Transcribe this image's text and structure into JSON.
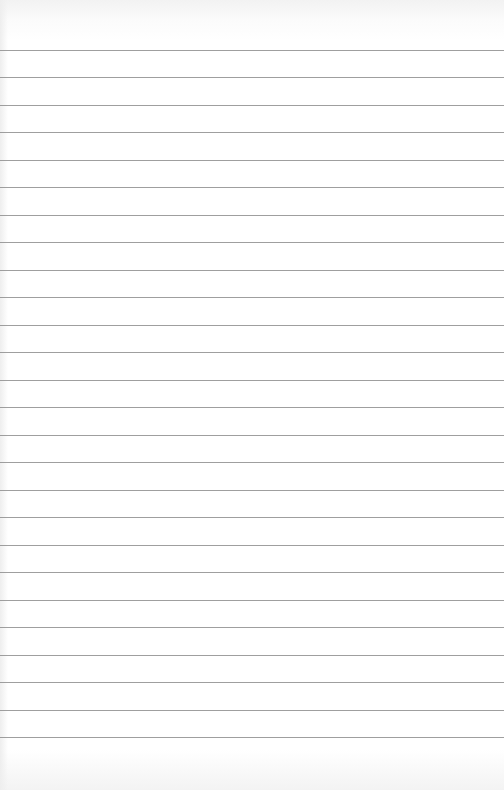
{
  "image": {
    "subject": "blank lined paper",
    "background_color": "#ffffff",
    "line_color": "#8e8e8e",
    "line_count": 26,
    "first_line_y": 50,
    "line_spacing": 27.48
  }
}
